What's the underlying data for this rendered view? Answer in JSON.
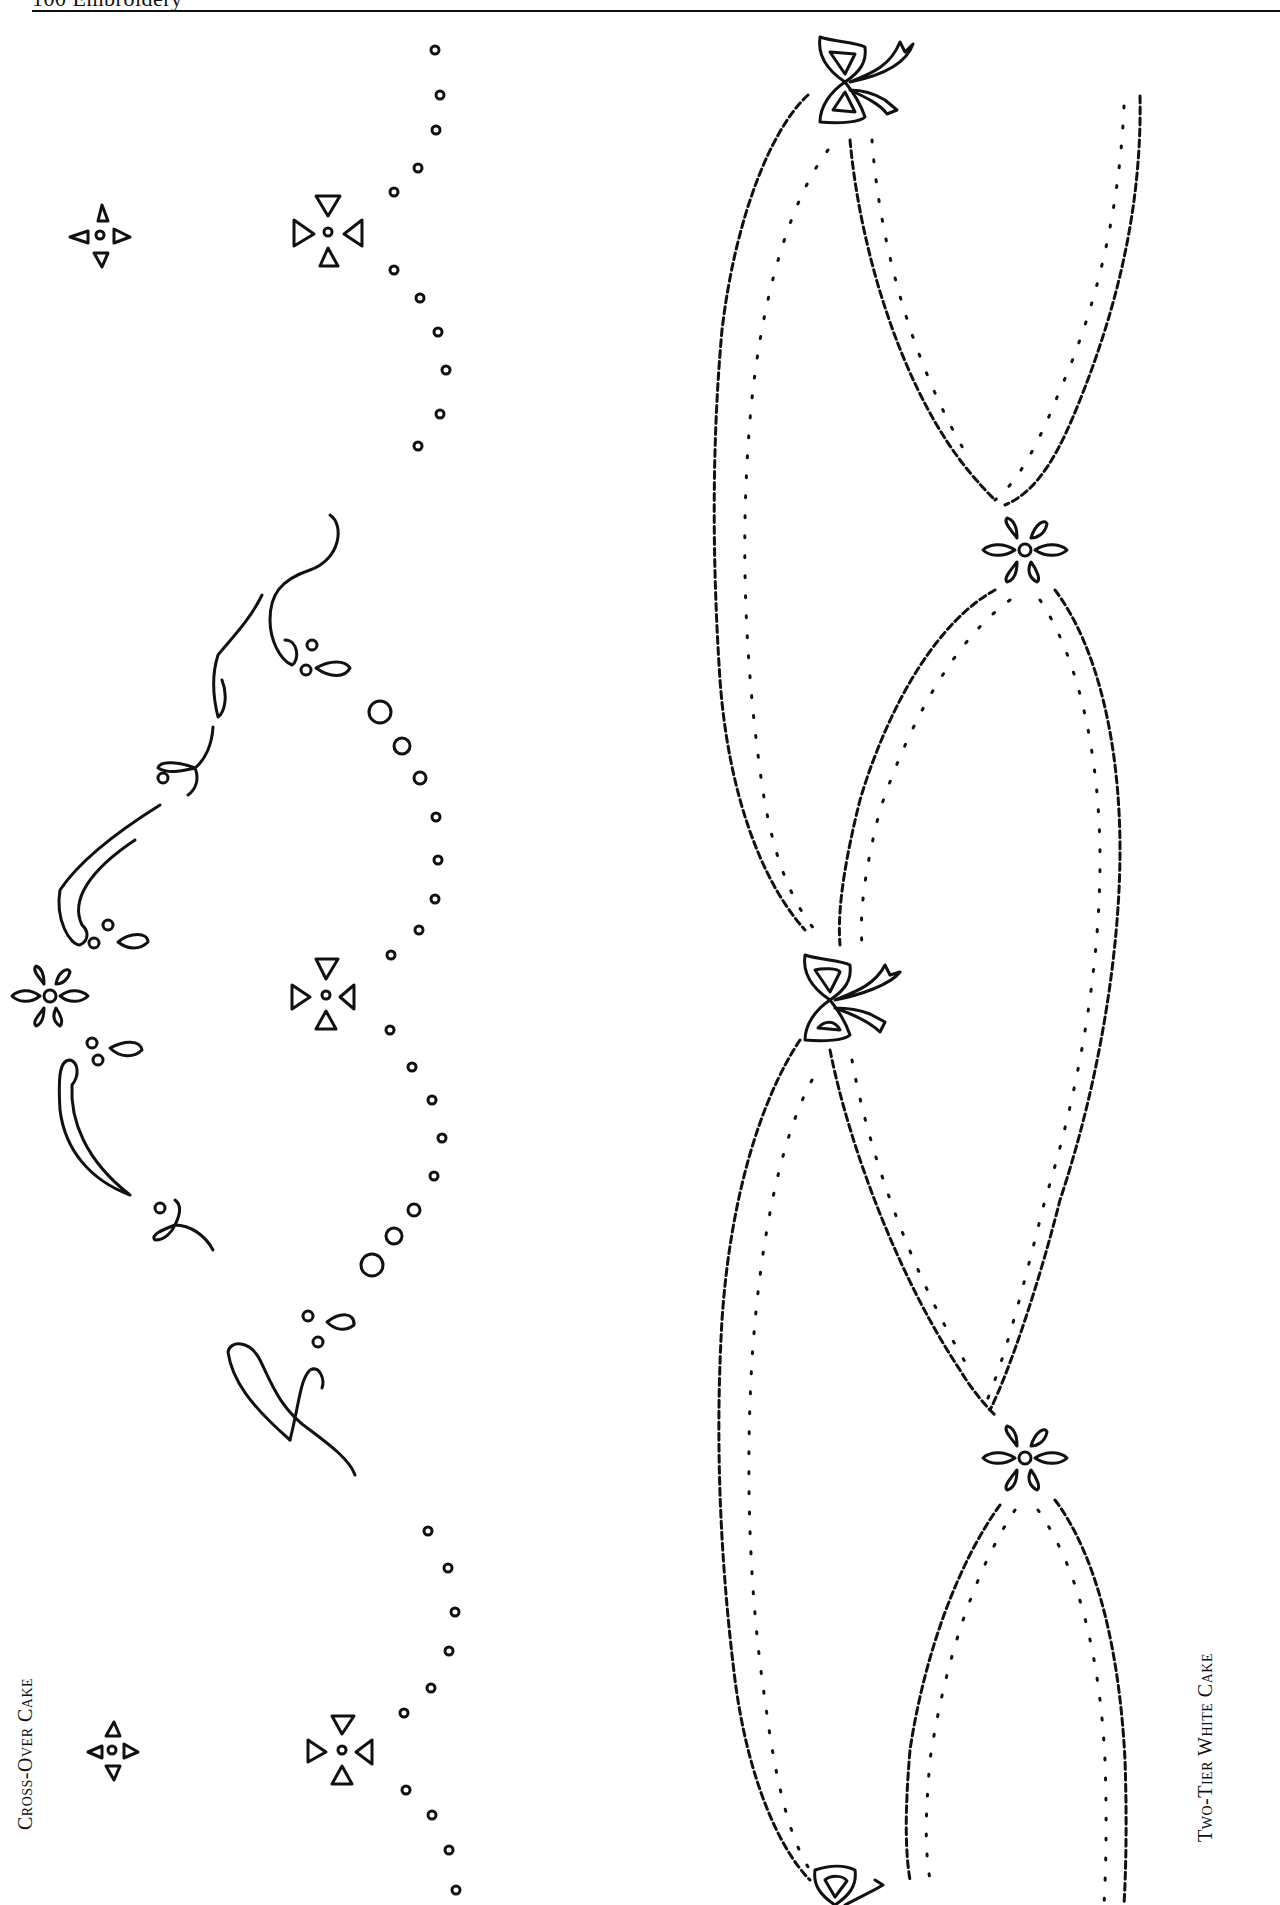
{
  "page": {
    "header": "100  Embroidery",
    "labels": {
      "left": "Cross-Over Cake",
      "right": "Two-Tier White Cake"
    }
  },
  "patterns": [
    {
      "name": "Cross-Over Cake",
      "elements": [
        "triangle-cross motifs",
        "dotted scallop borders",
        "teardrop vine swags",
        "six-petal daisies"
      ]
    },
    {
      "name": "Two-Tier White Cake",
      "elements": [
        "wavy scalloped garland ovals",
        "eyelet dot rows",
        "ribbon bows",
        "six-petal daisies"
      ]
    }
  ]
}
